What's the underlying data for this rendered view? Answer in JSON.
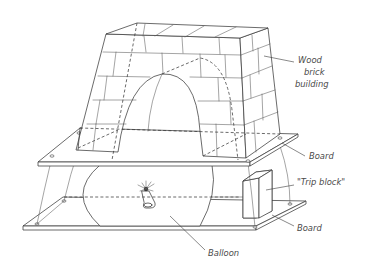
{
  "diagram": {
    "type": "technical-illustration",
    "labels": {
      "building": [
        "Wood",
        "brick",
        "building"
      ],
      "upper_board": "Board",
      "trip_block": "\"Trip block\"",
      "lower_board": "Board",
      "balloon": "Balloon"
    },
    "colors": {
      "line": "#3a3a3a",
      "text": "#4a4a4a",
      "background": "#ffffff"
    }
  }
}
